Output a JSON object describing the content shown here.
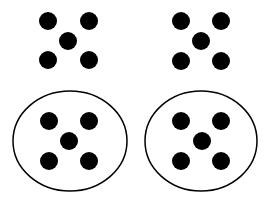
{
  "diagram": {
    "colors": {
      "background": "#ffffff",
      "dot": "#000000",
      "outline": "#000000"
    },
    "dot_radius": 9,
    "groups": [
      {
        "name": "top-left",
        "enclosed": false,
        "dots": [
          [
            48,
            21
          ],
          [
            89,
            21
          ],
          [
            68,
            41
          ],
          [
            48,
            60
          ],
          [
            89,
            60
          ]
        ]
      },
      {
        "name": "top-right",
        "enclosed": false,
        "dots": [
          [
            181,
            21
          ],
          [
            221,
            21
          ],
          [
            201,
            41
          ],
          [
            181,
            61
          ],
          [
            221,
            61
          ]
        ]
      },
      {
        "name": "bottom-left",
        "enclosed": true,
        "ellipse": {
          "cx": 70,
          "cy": 141,
          "rx": 57,
          "ry": 50
        },
        "dots": [
          [
            49,
            121
          ],
          [
            89,
            121
          ],
          [
            69,
            141
          ],
          [
            49,
            161
          ],
          [
            89,
            161
          ]
        ]
      },
      {
        "name": "bottom-right",
        "enclosed": true,
        "ellipse": {
          "cx": 201,
          "cy": 141,
          "rx": 56,
          "ry": 50
        },
        "dots": [
          [
            181,
            121
          ],
          [
            221,
            121
          ],
          [
            202,
            141
          ],
          [
            181,
            161
          ],
          [
            221,
            161
          ]
        ]
      }
    ]
  }
}
